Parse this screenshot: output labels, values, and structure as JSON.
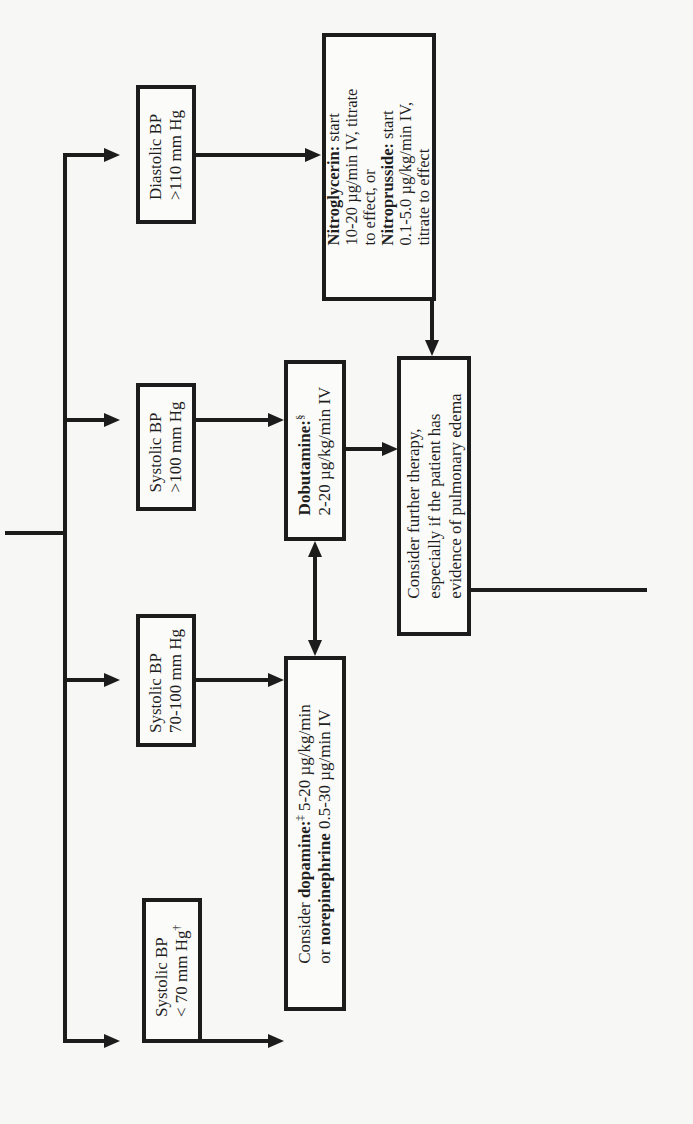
{
  "diagram": {
    "orientation": "rotated-90-ccw",
    "conditions": [
      {
        "id": "diastolic-high",
        "line1": "Diastolic BP",
        "line2": ">110 mm Hg",
        "mark": ""
      },
      {
        "id": "systolic-gt100",
        "line1": "Systolic BP",
        "line2": ">100 mm Hg",
        "mark": ""
      },
      {
        "id": "systolic-70-100",
        "line1": "Systolic BP",
        "line2": "70-100 mm Hg",
        "mark": ""
      },
      {
        "id": "systolic-lt70",
        "line1": "Systolic BP",
        "line2": "< 70 mm Hg",
        "mark": "†"
      }
    ],
    "treatments": {
      "nitro": {
        "l1_bold": "Nitroglycerin:",
        "l1_rest": " start",
        "l2": "10-20 µg/min IV, titrate",
        "l3": "to effect, or",
        "l4_bold": "Nitroprusside:",
        "l4_rest": " start",
        "l5": "0.1-5.0 µg/kg/min IV,",
        "l6": "titrate to effect"
      },
      "dobutamine": {
        "l1_bold": "Dobutamine:",
        "mark": "§",
        "l2": "2-20 µg/kg/min IV"
      },
      "dopamine": {
        "l1_pre": "Consider ",
        "l1_bold": "dopamine:",
        "mark": "‡",
        "l1_rest": " 5-20 µg/kg/min",
        "l2_pre": "or ",
        "l2_bold": "norepinephrine",
        "l2_rest": " 0.5-30 µg/min IV"
      }
    },
    "further": {
      "l1": "Consider further therapy,",
      "l2": "especially if the patient has",
      "l3": "evidence of pulmonary edema"
    },
    "colors": {
      "line": "#1c1c1c",
      "background": "#f7f7f5"
    }
  }
}
